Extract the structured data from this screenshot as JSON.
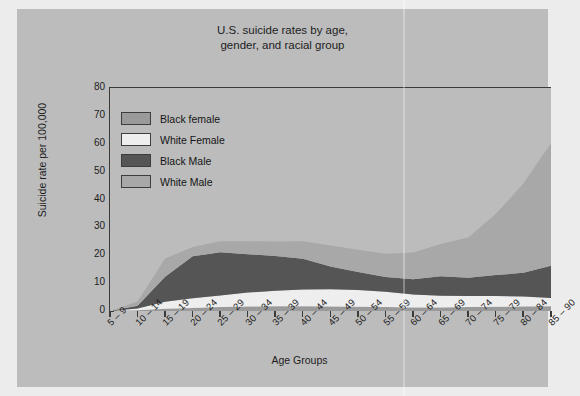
{
  "figure": {
    "title": "U.S. suicide rates by age,\ngender, and racial group",
    "background_color": "#bcbcbc",
    "page_color": "#ececed"
  },
  "axes": {
    "y_title": "Suicide rate per 100,000",
    "x_title": "Age Groups",
    "y_ticks": [
      "80",
      "70",
      "60",
      "50",
      "40",
      "30",
      "20",
      "10",
      "0"
    ]
  },
  "legend": {
    "items": [
      {
        "label": "Black female",
        "color": "#9a9a9a"
      },
      {
        "label": "White Female",
        "color": "#eeeeee"
      },
      {
        "label": "Black Male",
        "color": "#555555"
      },
      {
        "label": "White Male",
        "color": "#a8a8a8"
      }
    ]
  },
  "chart_data": {
    "type": "area",
    "stacked": true,
    "title": "U.S. suicide rates by age, gender, and racial group",
    "xlabel": "Age Groups",
    "ylabel": "Suicide rate per 100,000",
    "ylim": [
      0,
      80
    ],
    "ytick_step": 10,
    "grid": false,
    "legend_position": "upper-left-inside",
    "categories": [
      "5 – 9",
      "10 – 14",
      "15 – 19",
      "20 – 24",
      "25 – 29",
      "30 – 34",
      "35 – 39",
      "40 – 44",
      "45 – 49",
      "50 – 54",
      "55 – 59",
      "60 – 64",
      "65 – 69",
      "70 – 74",
      "75 – 79",
      "80 – 84",
      "85 – 90"
    ],
    "stack_order_bottom_to_top": [
      "Black female",
      "White Female",
      "Black Male",
      "White Male"
    ],
    "series": [
      {
        "name": "Black female",
        "color": "#9a9a9a",
        "values": [
          0.0,
          0.3,
          0.8,
          1.1,
          1.4,
          1.6,
          1.7,
          1.7,
          1.6,
          1.5,
          1.4,
          1.3,
          1.3,
          1.4,
          1.5,
          1.6,
          1.7
        ]
      },
      {
        "name": "White Female",
        "color": "#eeeeee",
        "values": [
          0.0,
          0.6,
          2.5,
          3.5,
          4.2,
          5.0,
          5.6,
          6.0,
          6.2,
          6.0,
          5.5,
          4.6,
          4.2,
          4.0,
          3.9,
          3.6,
          3.0
        ]
      },
      {
        "name": "Black Male",
        "color": "#555555",
        "values": [
          0.0,
          1.0,
          9.0,
          15.0,
          15.5,
          13.8,
          12.4,
          11.0,
          8.2,
          6.5,
          5.3,
          5.5,
          7.0,
          6.5,
          7.5,
          8.5,
          11.5
        ]
      },
      {
        "name": "White Male",
        "color": "#a8a8a8",
        "values": [
          0.0,
          1.5,
          6.5,
          3.4,
          3.9,
          4.6,
          5.2,
          6.3,
          7.5,
          8.0,
          8.3,
          9.6,
          11.5,
          14.5,
          22.0,
          32.0,
          44.0
        ]
      }
    ],
    "stack_totals": [
      0.0,
      3.4,
      18.8,
      23.0,
      25.0,
      25.0,
      24.9,
      25.0,
      23.5,
      22.0,
      20.5,
      21.0,
      24.0,
      26.4,
      34.9,
      45.7,
      60.2
    ]
  }
}
